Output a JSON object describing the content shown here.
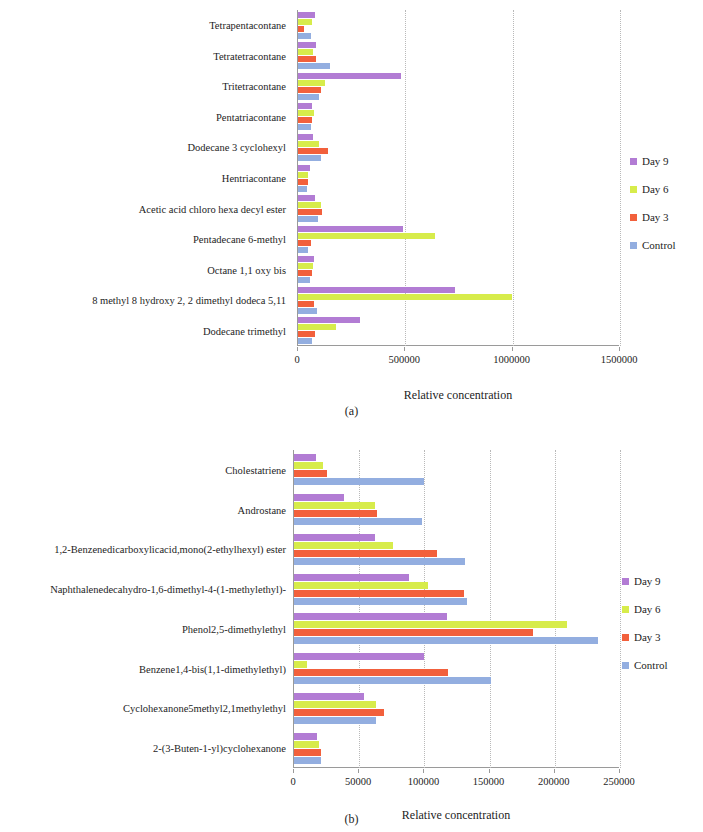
{
  "figure": {
    "panel_a_caption": "(a)",
    "panel_b_caption": "(b)",
    "series_colors": {
      "day9": "#b27cd4",
      "day6": "#d7ec4b",
      "day3": "#f2603c",
      "control": "#93aee0"
    }
  },
  "legend": {
    "items": [
      {
        "label": "Day 9",
        "color": "#b27cd4"
      },
      {
        "label": "Day 6",
        "color": "#d7ec4b"
      },
      {
        "label": "Day 3",
        "color": "#f2603c"
      },
      {
        "label": "Control",
        "color": "#93aee0"
      }
    ]
  },
  "chart_data": [
    {
      "type": "bar",
      "orientation": "horizontal",
      "panel": "(a)",
      "title": "",
      "xlabel": "Relative concentration",
      "ylabel": "",
      "xlim": [
        0,
        1500000
      ],
      "xticks": [
        0,
        500000,
        1000000,
        1500000
      ],
      "xtick_labels": [
        "0",
        "500000",
        "1000000",
        "1500000"
      ],
      "grid": true,
      "legend_position": "right",
      "categories": [
        "Tetrapentacontane",
        "Tetratetracontane",
        "Tritetracontane",
        "Pentatriacontane",
        "Dodecane 3 cyclohexyl",
        "Hentriacontane",
        "Acetic acid chloro hexa decyl ester",
        "Pentadecane 6-methyl",
        "Octane 1,1 oxy bis",
        "8 methyl 8 hydroxy 2, 2 dimethyl dodeca 5,11",
        "Dodecane trimethyl"
      ],
      "series": [
        {
          "name": "Day 9",
          "values": [
            80000,
            85000,
            480000,
            65000,
            70000,
            55000,
            80000,
            490000,
            75000,
            730000,
            290000
          ]
        },
        {
          "name": "Day 6",
          "values": [
            65000,
            70000,
            125000,
            75000,
            100000,
            48000,
            105000,
            640000,
            70000,
            995000,
            175000
          ]
        },
        {
          "name": "Day 3",
          "values": [
            30000,
            85000,
            105000,
            65000,
            140000,
            45000,
            110000,
            60000,
            65000,
            75000,
            80000
          ]
        },
        {
          "name": "Control",
          "values": [
            60000,
            150000,
            100000,
            60000,
            105000,
            42000,
            95000,
            45000,
            55000,
            90000,
            65000
          ]
        }
      ]
    },
    {
      "type": "bar",
      "orientation": "horizontal",
      "panel": "(b)",
      "title": "",
      "xlabel": "Relative concentration",
      "ylabel": "",
      "xlim": [
        0,
        250000
      ],
      "xticks": [
        0,
        50000,
        100000,
        150000,
        200000,
        250000
      ],
      "xtick_labels": [
        "0",
        "50000",
        "100000",
        "150000",
        "200000",
        "250000"
      ],
      "grid": true,
      "legend_position": "right",
      "categories": [
        "Cholestatriene",
        "Androstane",
        "1,2-Benzenedicarboxylicacid,mono(2-ethylhexyl) ester",
        "Naphthalenedecahydro-1,6-dimethyl-4-(1-methylethyl)-",
        "Phenol2,5-dimethylethyl",
        "Benzene1,4-bis(1,1-dimethylethyl)",
        "Cyclohexanone5methyl2,1methylethyl",
        "2-(3-Buten-1-yl)cyclohexanone"
      ],
      "series": [
        {
          "name": "Day 9",
          "values": [
            17000,
            38000,
            62000,
            88000,
            117000,
            100000,
            54000,
            18000
          ]
        },
        {
          "name": "Day 6",
          "values": [
            22000,
            62000,
            76000,
            103000,
            209000,
            10000,
            63000,
            19000
          ]
        },
        {
          "name": "Day 3",
          "values": [
            25000,
            64000,
            110000,
            130000,
            183000,
            118000,
            69000,
            21000
          ]
        },
        {
          "name": "Control",
          "values": [
            100000,
            98000,
            131000,
            133000,
            233000,
            151000,
            63000,
            21000
          ]
        }
      ]
    }
  ]
}
